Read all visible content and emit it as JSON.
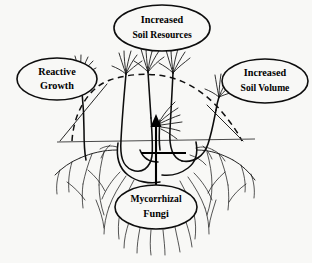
{
  "figure": {
    "background_color": "#f8f8f6",
    "ink_color": "#0d0d0d",
    "soil_line_color": "#4a4a4a"
  },
  "callouts": [
    {
      "id": "reactive-growth",
      "line1": "Reactive",
      "line2": "Growth",
      "cx": 57,
      "cy": 79,
      "rx": 40,
      "ry": 21
    },
    {
      "id": "increased-soil-resources",
      "line1": "Increased",
      "line2": "Soil Resources",
      "cx": 162,
      "cy": 28,
      "rx": 48,
      "ry": 23
    },
    {
      "id": "increased-soil-volume",
      "line1": "Increased",
      "line2": "Soil Volume",
      "cx": 265,
      "cy": 81,
      "rx": 43,
      "ry": 22
    },
    {
      "id": "mycorrhizal-fungi",
      "line1": "Mycorrhizal",
      "line2": "Fungi",
      "cx": 156,
      "cy": 207,
      "rx": 41,
      "ry": 22
    }
  ],
  "annotations": {
    "soil_surface_label": "soil surface line",
    "dashed_arc_label": "explored soil volume boundary",
    "arrow_label": "upward nutrient transfer arrow"
  }
}
